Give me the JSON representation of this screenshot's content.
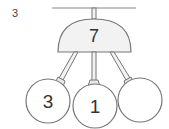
{
  "problem_number": "3",
  "diagram": {
    "type": "number-bond-mobile",
    "whole": "7",
    "parts": [
      {
        "position": "left",
        "value": "3"
      },
      {
        "position": "middle",
        "value": "1"
      },
      {
        "position": "right",
        "value": ""
      }
    ],
    "colors": {
      "stroke": "#777777",
      "dome_fill": "#f2f2f2",
      "circle_fill": "#ffffff",
      "text": "#333333"
    }
  }
}
